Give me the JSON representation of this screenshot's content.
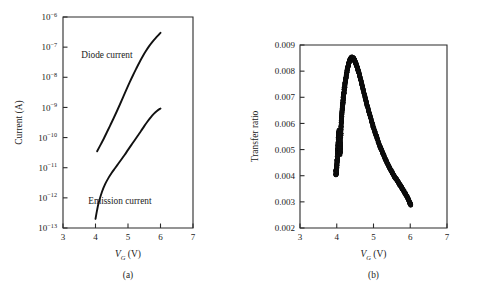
{
  "figure": {
    "background": "#ffffff",
    "ink": "#111111"
  },
  "panel_a": {
    "caption": "(a)",
    "xlabel_var": "V",
    "xlabel_sub": "G",
    "xlabel_unit": "(V)",
    "ylabel": "Current (A)",
    "annotations": [
      {
        "text": "Diode current",
        "x": 4.35,
        "y_decade": -7.35
      },
      {
        "text": "Emission current",
        "x": 4.75,
        "y_decade": -12.2
      }
    ]
  },
  "panel_b": {
    "caption": "(b)",
    "xlabel_var": "V",
    "xlabel_sub": "G",
    "xlabel_unit": "(V)",
    "ylabel": "Transfer ratio"
  },
  "chart_data": [
    {
      "id": "panel-a",
      "type": "line",
      "title": "",
      "xlabel": "V_G (V)",
      "ylabel": "Current (A)",
      "xlim": [
        3,
        7
      ],
      "ylim": [
        1e-13,
        1e-06
      ],
      "yscale": "log",
      "grid": false,
      "legend": "inline-annotations",
      "xticks": [
        3,
        4,
        5,
        6,
        7
      ],
      "xticklabels": [
        "3",
        "4",
        "5",
        "6",
        "7"
      ],
      "yticks": [
        1e-13,
        1e-12,
        1e-11,
        1e-10,
        1e-09,
        1e-08,
        1e-07,
        1e-06
      ],
      "yticklabels": [
        "10-13",
        "10-12",
        "10-11",
        "10-10",
        "10-9",
        "10-8",
        "10-7",
        "10-6"
      ],
      "yticklabel_bases": [
        "10",
        "10",
        "10",
        "10",
        "10",
        "10",
        "10",
        "10"
      ],
      "yticklabel_exponents": [
        "−13",
        "−12",
        "−11",
        "−10",
        "−9",
        "−8",
        "−7",
        "−6"
      ],
      "series": [
        {
          "name": "Diode current",
          "x": [
            4.05,
            4.15,
            4.25,
            4.35,
            4.45,
            4.55,
            4.65,
            4.75,
            4.85,
            4.95,
            5.05,
            5.15,
            5.25,
            5.35,
            5.45,
            5.55,
            5.65,
            5.75,
            5.85,
            5.95,
            6.0
          ],
          "y": [
            3.5e-11,
            5.6e-11,
            9e-11,
            1.5e-10,
            2.5e-10,
            4.2e-10,
            7.2e-10,
            1.25e-09,
            2.2e-09,
            3.9e-09,
            6.8e-09,
            1.15e-08,
            1.9e-08,
            3.1e-08,
            4.9e-08,
            7.4e-08,
            1.08e-07,
            1.5e-07,
            2e-07,
            2.6e-07,
            3e-07
          ]
        },
        {
          "name": "Emission current",
          "x": [
            4.0,
            4.05,
            4.1,
            4.2,
            4.3,
            4.4,
            4.5,
            4.6,
            4.7,
            4.8,
            4.9,
            5.0,
            5.1,
            5.2,
            5.3,
            5.4,
            5.5,
            5.6,
            5.7,
            5.8,
            5.9,
            6.0
          ],
          "y": [
            2e-13,
            4e-13,
            7e-13,
            1.6e-12,
            2.9e-12,
            4.6e-12,
            6.8e-12,
            9.6e-12,
            1.35e-11,
            1.9e-11,
            2.7e-11,
            3.9e-11,
            5.6e-11,
            8e-11,
            1.15e-10,
            1.65e-10,
            2.4e-10,
            3.4e-10,
            4.7e-10,
            6.2e-10,
            7.8e-10,
            9.2e-10
          ]
        }
      ]
    },
    {
      "id": "panel-b",
      "type": "scatter",
      "title": "",
      "xlabel": "V_G (V)",
      "ylabel": "Transfer ratio",
      "xlim": [
        3,
        7
      ],
      "ylim": [
        0.002,
        0.009
      ],
      "yscale": "linear",
      "grid": false,
      "legend": "none",
      "xticks": [
        3,
        4,
        5,
        6,
        7
      ],
      "xticklabels": [
        "3",
        "4",
        "5",
        "6",
        "7"
      ],
      "yticks": [
        0.002,
        0.003,
        0.004,
        0.005,
        0.006,
        0.007,
        0.008,
        0.009
      ],
      "yticklabels": [
        "0.002",
        "0.003",
        "0.004",
        "0.005",
        "0.006",
        "0.007",
        "0.008",
        "0.009"
      ],
      "series": [
        {
          "name": "Transfer ratio",
          "x": [
            3.97,
            3.99,
            4.0,
            4.01,
            4.02,
            4.03,
            4.04,
            4.05,
            4.06,
            4.07,
            4.08,
            4.09,
            4.1,
            4.11,
            4.12,
            4.14,
            4.16,
            4.18,
            4.2,
            4.23,
            4.26,
            4.29,
            4.32,
            4.35,
            4.38,
            4.41,
            4.44,
            4.47,
            4.5,
            4.55,
            4.6,
            4.66,
            4.72,
            4.8,
            4.88,
            4.96,
            5.05,
            5.15,
            5.25,
            5.35,
            5.45,
            5.55,
            5.65,
            5.75,
            5.85,
            5.95,
            6.02
          ],
          "y": [
            0.00415,
            0.00412,
            0.0043,
            0.00455,
            0.0048,
            0.00505,
            0.0053,
            0.00552,
            0.00568,
            0.0054,
            0.00505,
            0.0049,
            0.0052,
            0.0056,
            0.006,
            0.0064,
            0.00672,
            0.007,
            0.00724,
            0.00756,
            0.00784,
            0.00808,
            0.00826,
            0.0084,
            0.00848,
            0.00852,
            0.0085,
            0.00845,
            0.00836,
            0.00818,
            0.00795,
            0.00762,
            0.00728,
            0.00684,
            0.00642,
            0.00602,
            0.00562,
            0.00522,
            0.00487,
            0.00455,
            0.00427,
            0.00402,
            0.0038,
            0.00358,
            0.00335,
            0.0031,
            0.00285
          ],
          "noise_band": 0.00022,
          "noise_x_start": 3.97,
          "noise_x_end": 4.22,
          "marker": "filled-circle",
          "marker_size_px": 2.3,
          "color": "#0d0d0d"
        }
      ]
    }
  ]
}
